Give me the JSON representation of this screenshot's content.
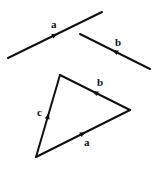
{
  "colors": {
    "line": "#111111",
    "background": "#ffffff"
  },
  "vectors": {
    "a": {
      "label": "a",
      "x1": 8,
      "y1": 58,
      "x2": 102,
      "y2": 12,
      "arrow_at": 0.5,
      "label_x": 51,
      "label_y": 28
    },
    "b": {
      "label": "b",
      "x1": 150,
      "y1": 69,
      "x2": 80,
      "y2": 34,
      "arrow_at": 0.5,
      "label_x": 115,
      "label_y": 46
    }
  },
  "triangle": {
    "vertices": {
      "bottom_left": [
        36,
        157
      ],
      "top": [
        60,
        75
      ],
      "right": [
        130,
        110
      ]
    },
    "sides": [
      {
        "label": "a",
        "from": "bottom_left",
        "to": "right",
        "label_x": 84,
        "label_y": 146
      },
      {
        "label": "b",
        "from": "right",
        "to": "top",
        "label_x": 97,
        "label_y": 86
      },
      {
        "label": "c",
        "from": "bottom_left",
        "to": "top",
        "label_x": 37,
        "label_y": 116
      }
    ]
  }
}
